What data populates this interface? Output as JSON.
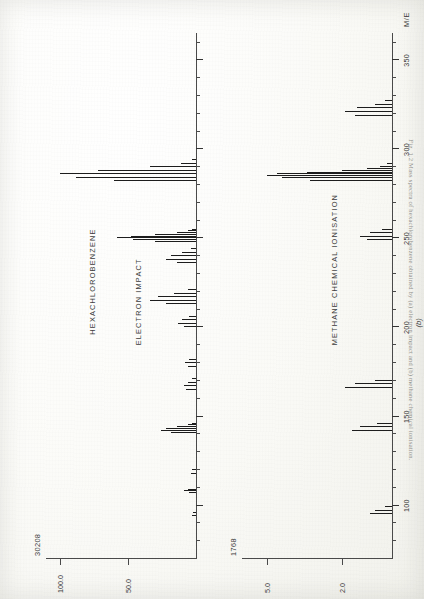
{
  "figure": {
    "compound": "HEXACHLOROBENZENE",
    "subfigure_label": "(b)",
    "x_axis_name": "M/E",
    "caption": "Fig. 1.2  Mass spectra of hexachlorobenzene obtained by (a) electron impact and (b) methane chemical ionisation."
  },
  "panels": [
    {
      "id": "electron-impact",
      "title": "ELECTRON IMPACT",
      "full_scale": "30208",
      "y_ticks": [
        "100.0",
        "50.0"
      ],
      "y_tick_values": [
        100.0,
        50.0
      ]
    },
    {
      "id": "methane-chemical-ionisation",
      "title": "METHANE CHEMICAL IONISATION",
      "full_scale": "1768",
      "y_ticks": [
        "5.0",
        "2.0"
      ],
      "y_tick_values": [
        5.0,
        2.0
      ]
    }
  ],
  "x_axis": {
    "tick_labels": [
      "100",
      "150",
      "200",
      "250",
      "300",
      "350"
    ],
    "tick_values": [
      100,
      150,
      200,
      250,
      300,
      350
    ],
    "minor_step": 10,
    "range": [
      70,
      362
    ]
  },
  "chart_data": {
    "type": "bar",
    "xlabel": "M/E",
    "ylabel": "Relative intensity (%)",
    "xlim": [
      70,
      362
    ],
    "grid": false,
    "legend": "none",
    "charts": [
      {
        "name": "ELECTRON IMPACT",
        "full_scale_counts": 30208,
        "ylim": [
          0,
          110
        ],
        "x": [
          94,
          96,
          107,
          108,
          109,
          118,
          120,
          141,
          142,
          143,
          144,
          145,
          146,
          165,
          167,
          169,
          171,
          178,
          180,
          182,
          200,
          202,
          204,
          206,
          213,
          215,
          217,
          219,
          221,
          236,
          238,
          240,
          242,
          244,
          248,
          249,
          250,
          251,
          252,
          253,
          254,
          255,
          282,
          284,
          286,
          288,
          290,
          292,
          294
        ],
        "y": [
          3,
          2,
          5,
          9,
          6,
          4,
          3,
          18,
          26,
          22,
          14,
          6,
          3,
          7,
          9,
          6,
          3,
          6,
          8,
          5,
          9,
          13,
          10,
          5,
          22,
          34,
          28,
          16,
          6,
          14,
          22,
          18,
          10,
          4,
          30,
          46,
          58,
          48,
          30,
          14,
          6,
          3,
          60,
          88,
          100,
          72,
          34,
          11,
          3
        ]
      },
      {
        "name": "METHANE CHEMICAL IONISATION",
        "full_scale_counts": 1768,
        "ylim": [
          0,
          6
        ],
        "x": [
          95,
          97,
          99,
          142,
          144,
          146,
          166,
          168,
          170,
          249,
          251,
          253,
          255,
          282,
          284,
          285,
          286,
          287,
          288,
          289,
          290,
          292,
          319,
          321,
          323,
          325,
          327
        ],
        "y": [
          0.9,
          0.7,
          0.3,
          1.6,
          1.3,
          0.6,
          1.9,
          1.5,
          0.7,
          1.0,
          1.3,
          0.9,
          0.4,
          3.3,
          4.4,
          5.0,
          4.6,
          3.4,
          2.0,
          1.0,
          0.5,
          0.2,
          1.5,
          1.9,
          1.4,
          0.7,
          0.3
        ]
      }
    ]
  }
}
